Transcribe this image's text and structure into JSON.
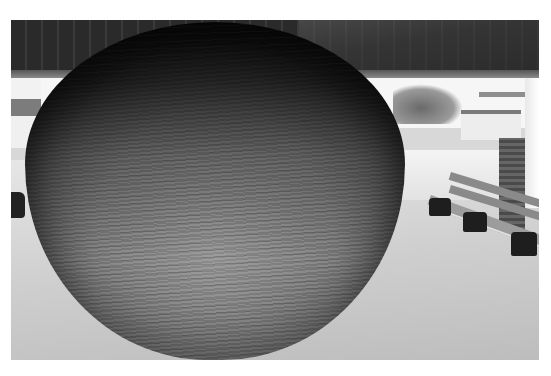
{
  "image": {
    "description": "Grayscale photograph of a giant ball of twine under an open pavilion roof, with a park bench and brick pillar to the right and a small building and trees in the background",
    "colors": {
      "border": "#ffffff",
      "roof": "#2a2a2a",
      "ball_light": "#c9c9c9",
      "ball_dark": "#1b1b1b",
      "floor": "#d0d0d0",
      "bench_legs": "#1e1e1e"
    }
  }
}
